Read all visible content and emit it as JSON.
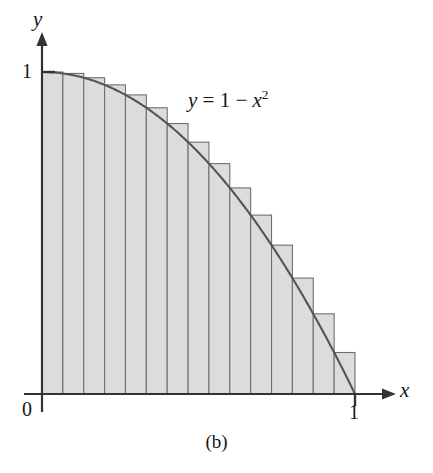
{
  "figure": {
    "caption": "(b)",
    "background_color": "#ffffff"
  },
  "axes": {
    "y_axis_name": "y",
    "x_axis_name": "x",
    "origin_label": "0",
    "x_tick_label": "1",
    "y_tick_label": "1",
    "axis_color": "#333333"
  },
  "annotations": {
    "curve_equation_prefix": "y",
    "curve_equation_body": " = 1 − ",
    "curve_equation_var": "x",
    "curve_equation_exponent": "2"
  },
  "style": {
    "rect_fill": "#dcdcdc",
    "rect_stroke": "#6f6f6f",
    "curve_color": "#555555"
  },
  "chart_data": {
    "type": "area",
    "title": "",
    "subtitle": "",
    "xlabel": "x",
    "ylabel": "y",
    "xlim": [
      0,
      1
    ],
    "ylim": [
      0,
      1
    ],
    "xticks": [
      0,
      1
    ],
    "xticklabels": [
      "0",
      "1"
    ],
    "yticks": [
      1
    ],
    "yticklabels": [
      "1"
    ],
    "grid": false,
    "legend": null,
    "annotations": [
      {
        "text": "y = 1 - x^2",
        "x": 0.47,
        "y": 0.83
      }
    ],
    "curve": {
      "name": "y = 1 - x^2",
      "expression": "1 - x*x",
      "domain": [
        0,
        1
      ],
      "color": "#555555"
    },
    "riemann_sum": {
      "rule": "left-endpoint",
      "description": "Upper (circumscribed) rectangles for the decreasing function y = 1 - x^2 on [0,1]",
      "n": 15,
      "dx": 0.0666667,
      "x_left": [
        0.0,
        0.0666667,
        0.1333333,
        0.2,
        0.2666667,
        0.3333333,
        0.4,
        0.4666667,
        0.5333333,
        0.6,
        0.6666667,
        0.7333333,
        0.8,
        0.8666667,
        0.9333333
      ],
      "x_right": [
        0.0666667,
        0.1333333,
        0.2,
        0.2666667,
        0.3333333,
        0.4,
        0.4666667,
        0.5333333,
        0.6,
        0.6666667,
        0.7333333,
        0.8,
        0.8666667,
        0.9333333,
        1.0
      ],
      "heights": [
        1.0,
        0.995556,
        0.982222,
        0.96,
        0.928889,
        0.888889,
        0.84,
        0.782222,
        0.715556,
        0.64,
        0.555556,
        0.462222,
        0.36,
        0.248889,
        0.128889
      ],
      "fill": "#dcdcdc",
      "stroke": "#6f6f6f",
      "sum": 0.702963
    }
  }
}
